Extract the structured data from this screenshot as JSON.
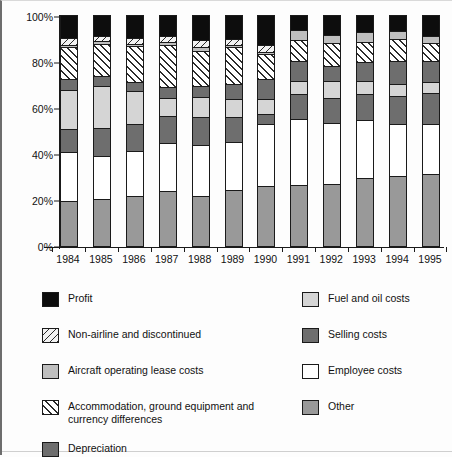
{
  "chart_data": {
    "type": "bar",
    "subtype": "stacked-percent",
    "title": "",
    "xlabel": "",
    "ylabel": "",
    "ylim": [
      0,
      100
    ],
    "ytick_labels": [
      "0%",
      "20%",
      "40%",
      "60%",
      "80%",
      "100%"
    ],
    "ytick_values": [
      0,
      20,
      40,
      60,
      80,
      100
    ],
    "grid": false,
    "legend_position": "bottom",
    "stack_order_bottom_to_top": [
      "Other",
      "Employee costs",
      "Selling costs",
      "Fuel and oil costs",
      "Depreciation",
      "Accommodation, ground equipment and currency differences",
      "Aircraft operating lease costs",
      "Non-airline and discontinued",
      "Profit"
    ],
    "categories": [
      "1984",
      "1985",
      "1986",
      "1987",
      "1988",
      "1989",
      "1990",
      "1991",
      "1992",
      "1993",
      "1994",
      "1995"
    ],
    "series": [
      {
        "name": "Other",
        "key": "other",
        "color": "#999999",
        "pattern": "solid",
        "values": [
          19,
          20,
          21.5,
          23.5,
          21.5,
          24,
          25.5,
          26,
          26.5,
          29,
          30,
          31
        ]
      },
      {
        "name": "Employee costs",
        "key": "employee",
        "color": "#ffffff",
        "pattern": "solid",
        "values": [
          21.5,
          18.5,
          19.5,
          21,
          22,
          21,
          27,
          29,
          26.5,
          25.5,
          22.5,
          21.5
        ]
      },
      {
        "name": "Selling costs",
        "key": "selling",
        "color": "#6e6e6e",
        "pattern": "solid",
        "values": [
          10,
          12.5,
          11.5,
          11.5,
          12,
          10.5,
          4.5,
          10.5,
          11,
          11,
          12.5,
          13.5
        ]
      },
      {
        "name": "Fuel and oil costs",
        "key": "fuel",
        "color": "#d5d5d5",
        "pattern": "solid",
        "values": [
          17,
          18,
          14.5,
          8,
          9,
          8,
          6.5,
          6,
          7.5,
          6,
          5,
          5
        ]
      },
      {
        "name": "Depreciation",
        "key": "deprec",
        "color": "#6e6e6e",
        "pattern": "solid",
        "values": [
          4.5,
          4.5,
          4,
          4.5,
          4.5,
          6.5,
          8.5,
          8.5,
          6.5,
          8,
          10,
          9
        ]
      },
      {
        "name": "Accommodation, ground equipment and currency differences",
        "key": "accom",
        "color": "#ffffff",
        "pattern": "hatch-forward",
        "values": [
          14,
          14,
          15.5,
          18.5,
          15.5,
          16,
          11,
          9,
          10,
          9,
          9.5,
          8
        ]
      },
      {
        "name": "Aircraft operating lease costs",
        "key": "lease",
        "color": "#bfbfbf",
        "pattern": "solid",
        "values": [
          1,
          1,
          1,
          1.5,
          1.5,
          1,
          1,
          4.5,
          3.5,
          4,
          3.5,
          3
        ]
      },
      {
        "name": "Non-airline and discontinued",
        "key": "nonair",
        "color": "#f2f2f2",
        "pattern": "hatch-back",
        "values": [
          3,
          2.5,
          2.5,
          2.5,
          3,
          2.5,
          3,
          0,
          0,
          0,
          0,
          0
        ]
      },
      {
        "name": "Profit",
        "key": "profit",
        "color": "#0d0d0d",
        "pattern": "solid",
        "values": [
          10,
          9,
          10,
          9,
          11,
          10.5,
          13,
          6.5,
          8.5,
          7.5,
          7,
          9
        ]
      }
    ]
  },
  "legend": {
    "left_column": [
      {
        "label": "Profit",
        "swatch": "profit-swatch",
        "pattern": "solid",
        "color": "#0d0d0d"
      },
      {
        "label": "Non-airline and discontinued",
        "swatch": "nonairline-swatch",
        "pattern": "hatch-back",
        "color": "#f2f2f2"
      },
      {
        "label": "Aircraft operating lease costs",
        "swatch": "lease-swatch",
        "pattern": "solid",
        "color": "#bfbfbf"
      },
      {
        "label": "Accommodation, ground equipment and\ncurrency differences",
        "swatch": "accom-swatch",
        "pattern": "hatch-forward",
        "color": "#ffffff"
      },
      {
        "label": "Depreciation",
        "swatch": "deprec-swatch",
        "pattern": "solid",
        "color": "#6e6e6e"
      }
    ],
    "right_column": [
      {
        "label": "Fuel and oil costs",
        "swatch": "fuel-swatch",
        "pattern": "solid",
        "color": "#d5d5d5"
      },
      {
        "label": "Selling costs",
        "swatch": "selling-swatch",
        "pattern": "solid",
        "color": "#6e6e6e"
      },
      {
        "label": "Employee costs",
        "swatch": "employee-swatch",
        "pattern": "solid",
        "color": "#ffffff"
      },
      {
        "label": "Other",
        "swatch": "other-swatch",
        "pattern": "solid",
        "color": "#999999"
      }
    ]
  }
}
